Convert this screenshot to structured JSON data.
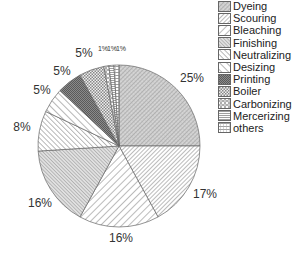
{
  "chart_data": {
    "type": "pie",
    "title": "",
    "start_angle": "12 o'clock",
    "direction": "clockwise",
    "categories": [
      "Dyeing",
      "Scouring",
      "Bleaching",
      "Finishing",
      "Neutralizing",
      "Desizing",
      "Printing",
      "Boiler",
      "Carbonizing",
      "Mercerizing",
      "others"
    ],
    "values": [
      25,
      17,
      16,
      16,
      8,
      5,
      5,
      5,
      1,
      1,
      1
    ],
    "labels": [
      "25%",
      "17%",
      "16%",
      "16%",
      "8%",
      "5%",
      "5%",
      "5%",
      "1%",
      "1%",
      "1%"
    ],
    "legend_position": "right-top"
  },
  "legend": {
    "items": [
      {
        "label": "Dyeing",
        "pattern": "dense-diag-crosshatch"
      },
      {
        "label": "Scouring",
        "pattern": "diag-right-dense"
      },
      {
        "label": "Bleaching",
        "pattern": "diag-right-wide"
      },
      {
        "label": "Finishing",
        "pattern": "diag-left-dense"
      },
      {
        "label": "Neutralizing",
        "pattern": "diag-left-medium"
      },
      {
        "label": "Desizing",
        "pattern": "diag-left-wide"
      },
      {
        "label": "Printing",
        "pattern": "dark-checker"
      },
      {
        "label": "Boiler",
        "pattern": "checker"
      },
      {
        "label": "Carbonizing",
        "pattern": "circles"
      },
      {
        "label": "Mercerizing",
        "pattern": "horizontal-dense"
      },
      {
        "label": "others",
        "pattern": "horizontal-wide"
      }
    ]
  }
}
